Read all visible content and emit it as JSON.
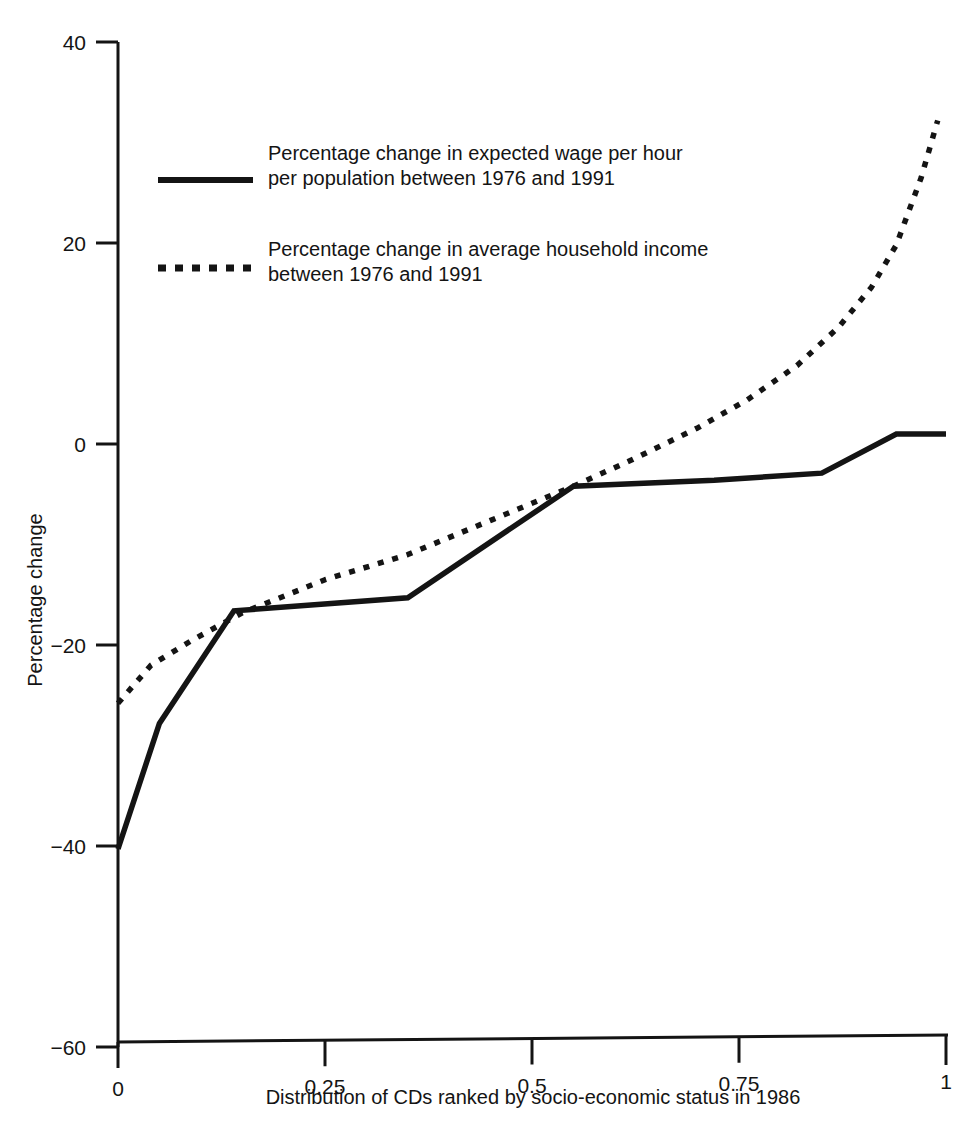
{
  "chart_data": {
    "type": "line",
    "title": "",
    "xlabel": "Distribution of CDs ranked by socio-economic status in 1986",
    "ylabel": "Percentage change",
    "xlim": [
      0,
      1
    ],
    "ylim": [
      -60,
      40
    ],
    "xticks": [
      "0",
      "0.25",
      "0.5",
      "0.75",
      "1"
    ],
    "xtick_values": [
      0,
      0.25,
      0.5,
      0.75,
      1
    ],
    "yticks": [
      "40",
      "20",
      "0",
      "−20",
      "−40",
      "−60"
    ],
    "ytick_values": [
      40,
      20,
      0,
      -20,
      -40,
      -60
    ],
    "grid": false,
    "legend_position": "upper-left-inside",
    "series": [
      {
        "name": "Percentage change in expected wage per hour per population between 1976 and 1991",
        "style": "solid",
        "color": "#141414",
        "x": [
          0.0,
          0.05,
          0.14,
          0.35,
          0.55,
          0.72,
          0.85,
          0.94,
          1.0
        ],
        "y": [
          -40.3,
          -27.8,
          -16.6,
          -15.3,
          -4.2,
          -3.6,
          -2.9,
          1.0,
          1.0
        ]
      },
      {
        "name": "Percentage change in average household income between 1976 and 1991",
        "style": "dotted",
        "color": "#141414",
        "x": [
          0.0,
          0.04,
          0.09,
          0.15,
          0.25,
          0.35,
          0.45,
          0.55,
          0.62,
          0.7,
          0.76,
          0.82,
          0.87,
          0.91,
          0.94,
          0.97,
          0.99
        ],
        "y": [
          -25.8,
          -22.0,
          -19.5,
          -16.8,
          -13.5,
          -11.0,
          -7.6,
          -4.2,
          -1.6,
          1.6,
          4.4,
          7.8,
          11.6,
          15.6,
          19.8,
          26.5,
          32.2
        ]
      }
    ]
  },
  "legend": {
    "entries": [
      {
        "swatch": "solid-line-swatch",
        "line1": "Percentage change in expected wage per hour",
        "line2": "per population between 1976 and 1991"
      },
      {
        "swatch": "dotted-line-swatch",
        "line1": "Percentage change in average household income",
        "line2": "between 1976 and 1991"
      }
    ]
  }
}
